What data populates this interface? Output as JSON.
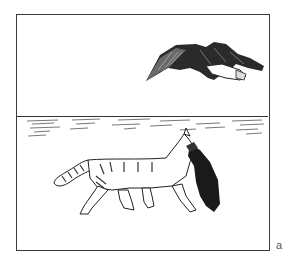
{
  "figure": {
    "panel_label": "a",
    "scene": {
      "upper": {
        "subject": "flying-bird-carrying-prey"
      },
      "lower": {
        "subject": "tabby-cat-carrying-bird",
        "ground": "hatched-water-lines"
      }
    },
    "colors": {
      "ink": "#1a1a1a",
      "frame": "#3a3a3a",
      "background": "#ffffff",
      "label": "#555555"
    }
  }
}
